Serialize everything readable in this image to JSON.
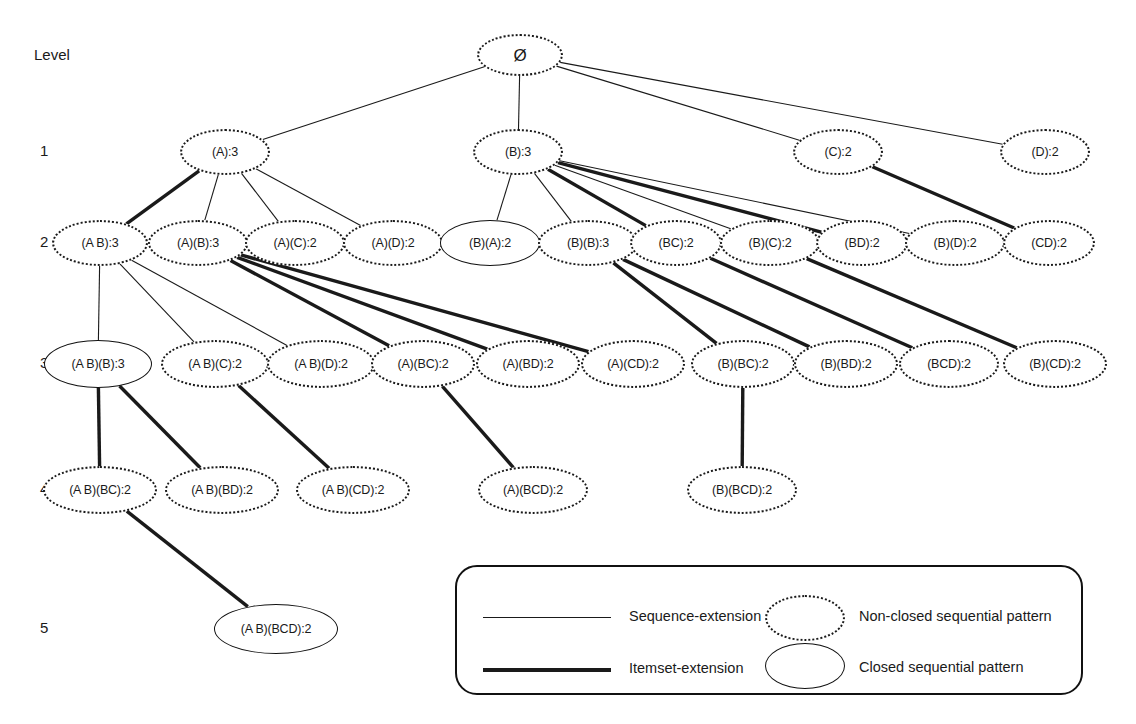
{
  "diagram": {
    "title_label": "Level",
    "level_labels": [
      "1",
      "2",
      "3",
      "4",
      "5"
    ],
    "root": {
      "label": "Ø",
      "closed": false,
      "x": 520,
      "y": 55,
      "w": 86,
      "h": 42
    },
    "levels": [
      {
        "level": "1",
        "y": 152,
        "nodes": [
          {
            "label": "(A):3",
            "closed": false,
            "x": 225,
            "w": 90,
            "h": 46
          },
          {
            "label": "(B):3",
            "closed": false,
            "x": 518,
            "w": 90,
            "h": 46
          },
          {
            "label": "(C):2",
            "closed": false,
            "x": 838,
            "w": 90,
            "h": 46
          },
          {
            "label": "(D):2",
            "closed": false,
            "x": 1045,
            "w": 90,
            "h": 46
          }
        ]
      },
      {
        "level": "2",
        "y": 243,
        "nodes": [
          {
            "label": "(A B):3",
            "closed": false,
            "x": 100,
            "w": 96,
            "h": 46
          },
          {
            "label": "(A)(B):3",
            "closed": false,
            "x": 198,
            "w": 100,
            "h": 46
          },
          {
            "label": "(A)(C):2",
            "closed": false,
            "x": 295,
            "w": 100,
            "h": 46
          },
          {
            "label": "(A)(D):2",
            "closed": false,
            "x": 393,
            "w": 100,
            "h": 46
          },
          {
            "label": "(B)(A):2",
            "closed": true,
            "x": 490,
            "w": 100,
            "h": 46
          },
          {
            "label": "(B)(B):3",
            "closed": false,
            "x": 588,
            "w": 100,
            "h": 46
          },
          {
            "label": "(BC):2",
            "closed": false,
            "x": 676,
            "w": 92,
            "h": 46
          },
          {
            "label": "(B)(C):2",
            "closed": false,
            "x": 770,
            "w": 100,
            "h": 46
          },
          {
            "label": "(BD):2",
            "closed": false,
            "x": 862,
            "w": 92,
            "h": 46
          },
          {
            "label": "(B)(D):2",
            "closed": false,
            "x": 955,
            "w": 100,
            "h": 46
          },
          {
            "label": "(CD):2",
            "closed": false,
            "x": 1049,
            "w": 92,
            "h": 46
          }
        ]
      },
      {
        "level": "3",
        "y": 364,
        "nodes": [
          {
            "label": "(A B)(B):3",
            "closed": true,
            "x": 98,
            "w": 108,
            "h": 48
          },
          {
            "label": "(A B)(C):2",
            "closed": false,
            "x": 215,
            "w": 108,
            "h": 48
          },
          {
            "label": "(A B)(D):2",
            "closed": false,
            "x": 321,
            "w": 108,
            "h": 48
          },
          {
            "label": "(A)(BC):2",
            "closed": false,
            "x": 423,
            "w": 104,
            "h": 48
          },
          {
            "label": "(A)(BD):2",
            "closed": false,
            "x": 528,
            "w": 104,
            "h": 48
          },
          {
            "label": "(A)(CD):2",
            "closed": false,
            "x": 633,
            "w": 104,
            "h": 48
          },
          {
            "label": "(B)(BC):2",
            "closed": false,
            "x": 743,
            "w": 104,
            "h": 48
          },
          {
            "label": "(B)(BD):2",
            "closed": false,
            "x": 846,
            "w": 104,
            "h": 48
          },
          {
            "label": "(BCD):2",
            "closed": false,
            "x": 949,
            "w": 100,
            "h": 48
          },
          {
            "label": "(B)(CD):2",
            "closed": false,
            "x": 1055,
            "w": 104,
            "h": 48
          }
        ]
      },
      {
        "level": "4",
        "y": 490,
        "nodes": [
          {
            "label": "(A B)(BC):2",
            "closed": false,
            "x": 100,
            "w": 114,
            "h": 48
          },
          {
            "label": "(A B)(BD):2",
            "closed": false,
            "x": 222,
            "w": 114,
            "h": 48
          },
          {
            "label": "(A B)(CD):2",
            "closed": false,
            "x": 353,
            "w": 114,
            "h": 48
          },
          {
            "label": "(A)(BCD):2",
            "closed": false,
            "x": 533,
            "w": 110,
            "h": 48
          },
          {
            "label": "(B)(BCD):2",
            "closed": false,
            "x": 742,
            "w": 110,
            "h": 48
          }
        ]
      },
      {
        "level": "5",
        "y": 629,
        "nodes": [
          {
            "label": "(A B)(BCD):2",
            "closed": true,
            "x": 276,
            "w": 124,
            "h": 50
          }
        ]
      }
    ],
    "edges": [
      {
        "from": [
          520,
          55
        ],
        "to": [
          225,
          152
        ],
        "type": "sequence"
      },
      {
        "from": [
          520,
          55
        ],
        "to": [
          518,
          152
        ],
        "type": "sequence"
      },
      {
        "from": [
          520,
          55
        ],
        "to": [
          838,
          152
        ],
        "type": "sequence"
      },
      {
        "from": [
          520,
          55
        ],
        "to": [
          1045,
          152
        ],
        "type": "sequence"
      },
      {
        "from": [
          225,
          152
        ],
        "to": [
          100,
          243
        ],
        "type": "itemset"
      },
      {
        "from": [
          225,
          152
        ],
        "to": [
          198,
          243
        ],
        "type": "sequence"
      },
      {
        "from": [
          225,
          152
        ],
        "to": [
          295,
          243
        ],
        "type": "sequence"
      },
      {
        "from": [
          225,
          152
        ],
        "to": [
          393,
          243
        ],
        "type": "sequence"
      },
      {
        "from": [
          518,
          152
        ],
        "to": [
          490,
          243
        ],
        "type": "sequence"
      },
      {
        "from": [
          518,
          152
        ],
        "to": [
          588,
          243
        ],
        "type": "sequence"
      },
      {
        "from": [
          518,
          152
        ],
        "to": [
          676,
          243
        ],
        "type": "itemset"
      },
      {
        "from": [
          518,
          152
        ],
        "to": [
          770,
          243
        ],
        "type": "sequence"
      },
      {
        "from": [
          518,
          152
        ],
        "to": [
          862,
          243
        ],
        "type": "itemset"
      },
      {
        "from": [
          518,
          152
        ],
        "to": [
          955,
          243
        ],
        "type": "sequence"
      },
      {
        "from": [
          838,
          152
        ],
        "to": [
          1049,
          243
        ],
        "type": "itemset"
      },
      {
        "from": [
          100,
          243
        ],
        "to": [
          98,
          364
        ],
        "type": "sequence"
      },
      {
        "from": [
          100,
          243
        ],
        "to": [
          215,
          364
        ],
        "type": "sequence"
      },
      {
        "from": [
          100,
          243
        ],
        "to": [
          321,
          364
        ],
        "type": "sequence"
      },
      {
        "from": [
          198,
          243
        ],
        "to": [
          423,
          364
        ],
        "type": "itemset"
      },
      {
        "from": [
          198,
          243
        ],
        "to": [
          528,
          364
        ],
        "type": "itemset"
      },
      {
        "from": [
          198,
          243
        ],
        "to": [
          633,
          364
        ],
        "type": "itemset"
      },
      {
        "from": [
          588,
          243
        ],
        "to": [
          743,
          364
        ],
        "type": "itemset"
      },
      {
        "from": [
          588,
          243
        ],
        "to": [
          846,
          364
        ],
        "type": "itemset"
      },
      {
        "from": [
          676,
          243
        ],
        "to": [
          949,
          364
        ],
        "type": "itemset"
      },
      {
        "from": [
          770,
          243
        ],
        "to": [
          1055,
          364
        ],
        "type": "itemset"
      },
      {
        "from": [
          98,
          364
        ],
        "to": [
          100,
          490
        ],
        "type": "itemset"
      },
      {
        "from": [
          98,
          364
        ],
        "to": [
          222,
          490
        ],
        "type": "itemset"
      },
      {
        "from": [
          215,
          364
        ],
        "to": [
          353,
          490
        ],
        "type": "itemset"
      },
      {
        "from": [
          423,
          364
        ],
        "to": [
          533,
          490
        ],
        "type": "itemset"
      },
      {
        "from": [
          743,
          364
        ],
        "to": [
          742,
          490
        ],
        "type": "itemset"
      },
      {
        "from": [
          100,
          490
        ],
        "to": [
          276,
          629
        ],
        "type": "itemset"
      }
    ]
  },
  "legend": {
    "items": [
      {
        "kind": "line",
        "style": "thin",
        "label": "Sequence-extension"
      },
      {
        "kind": "ellipse",
        "style": "dotted",
        "label": "Non-closed sequential pattern"
      },
      {
        "kind": "line",
        "style": "thick",
        "label": "Itemset-extension"
      },
      {
        "kind": "ellipse",
        "style": "solid",
        "label": "Closed sequential pattern"
      }
    ]
  },
  "colors": {
    "ink": "#1a1a1a",
    "background": "#ffffff"
  }
}
